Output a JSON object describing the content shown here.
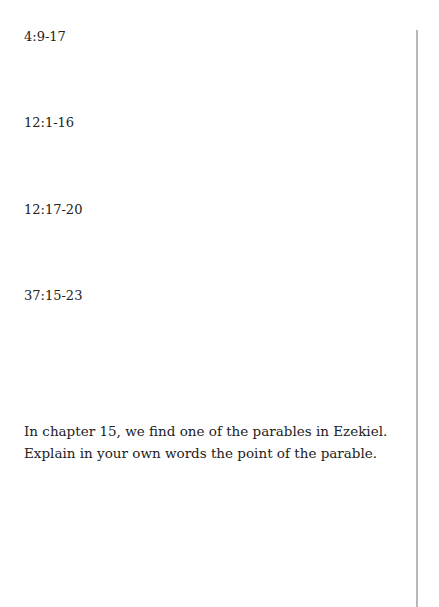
{
  "references": [
    "4:9-17",
    "12:1-16",
    "12:17-20",
    "37:15-23"
  ],
  "question": "In chapter 15, we find one of the parables in Ezekiel. Explain in your own words the point of the parable.",
  "colors": {
    "text": "#222222",
    "rule": "#b8b8b8",
    "background": "#ffffff"
  }
}
